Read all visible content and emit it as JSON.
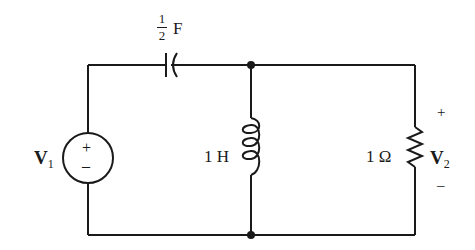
{
  "diagram": {
    "type": "electrical-circuit",
    "components": {
      "source": {
        "label": "V",
        "subscript": "1",
        "plus": "+",
        "minus": "–"
      },
      "capacitor": {
        "numerator": "1",
        "denominator": "2",
        "unit": "F"
      },
      "inductor": {
        "label": "1 H"
      },
      "resistor": {
        "label": "1 Ω"
      },
      "output": {
        "label": "V",
        "subscript": "2",
        "plus": "+",
        "minus": "–"
      }
    },
    "colors": {
      "ink": "#1a1a1a",
      "background": "#ffffff"
    }
  }
}
